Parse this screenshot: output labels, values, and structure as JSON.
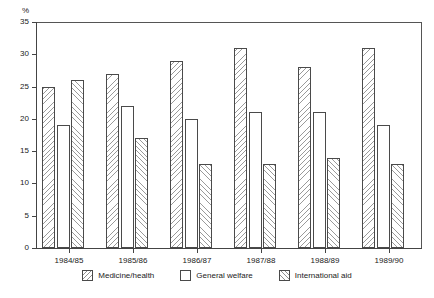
{
  "chart_data": {
    "type": "bar",
    "title": "",
    "xlabel": "",
    "ylabel": "%",
    "ylim": [
      0,
      35
    ],
    "yticks": [
      0,
      5,
      10,
      15,
      20,
      25,
      30,
      35
    ],
    "grid": false,
    "legend_position": "bottom",
    "categories": [
      "1984/85",
      "1985/86",
      "1986/87",
      "1987/88",
      "1988/89",
      "1989/90"
    ],
    "series": [
      {
        "name": "Medicine/health",
        "pattern": "diagonal-backslash-hatch",
        "values": [
          25,
          27,
          29,
          31,
          28,
          31
        ]
      },
      {
        "name": "General welfare",
        "pattern": "white-unfilled",
        "values": [
          19,
          22,
          20,
          21,
          21,
          19
        ]
      },
      {
        "name": "International aid",
        "pattern": "diagonal-forwardslash-hatch",
        "values": [
          26,
          17,
          13,
          13,
          14,
          13
        ]
      }
    ]
  },
  "axis": {
    "y_unit_label": "%"
  },
  "legend": {
    "items": [
      {
        "label": "Medicine/health"
      },
      {
        "label": "General welfare"
      },
      {
        "label": "International aid"
      }
    ]
  },
  "colors": {
    "axis": "#444444",
    "frame": "#555555",
    "bar_outline": "#4a4a4a",
    "hatch": "#9a9a9a",
    "background": "#ffffff",
    "text": "#222222"
  }
}
